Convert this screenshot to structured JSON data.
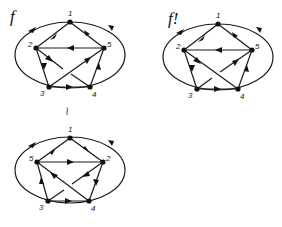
{
  "diagram": {
    "type": "directed-graph-comparison",
    "graphs": [
      {
        "id": "f",
        "label": "f",
        "nodes": [
          {
            "id": "1",
            "label": "1",
            "x": 70,
            "y": 22
          },
          {
            "id": "2",
            "label": "2",
            "x": 36,
            "y": 48
          },
          {
            "id": "5",
            "label": "5",
            "x": 104,
            "y": 48
          },
          {
            "id": "3",
            "label": "3",
            "x": 49,
            "y": 87
          },
          {
            "id": "4",
            "label": "4",
            "x": 90,
            "y": 87
          }
        ],
        "edges": [
          [
            "1",
            "2"
          ],
          [
            "5",
            "1"
          ],
          [
            "5",
            "2"
          ],
          [
            "2",
            "3"
          ],
          [
            "2",
            "4"
          ],
          [
            "3",
            "5"
          ],
          [
            "3",
            "4"
          ],
          [
            "4",
            "5"
          ]
        ],
        "outer_ellipse": {
          "cx": 70,
          "cy": 55,
          "rx": 55,
          "ry": 34,
          "arcs": [
            "1→3 (left)",
            "4→1 (right)"
          ]
        }
      },
      {
        "id": "f!",
        "label": "f!",
        "nodes": [
          {
            "id": "1",
            "label": "1",
            "x": 218,
            "y": 24
          },
          {
            "id": "2",
            "label": "2",
            "x": 184,
            "y": 50
          },
          {
            "id": "5",
            "label": "5",
            "x": 252,
            "y": 50
          },
          {
            "id": "3",
            "label": "3",
            "x": 197,
            "y": 89
          },
          {
            "id": "4",
            "label": "4",
            "x": 238,
            "y": 89
          }
        ],
        "edges": [
          [
            "1",
            "2"
          ],
          [
            "5",
            "1"
          ],
          [
            "5",
            "2"
          ],
          [
            "2",
            "3"
          ],
          [
            "2",
            "4"
          ],
          [
            "3",
            "5"
          ],
          [
            "3",
            "4"
          ],
          [
            "4",
            "5"
          ]
        ],
        "outer_ellipse": {
          "cx": 218,
          "cy": 57,
          "rx": 55,
          "ry": 34,
          "arcs": [
            "1→3 (left)",
            "4→1 (right)"
          ]
        }
      },
      {
        "id": "f-relabeled",
        "label": "",
        "nodes": [
          {
            "id": "1",
            "label": "1",
            "x": 70,
            "y": 138
          },
          {
            "id": "5",
            "label": "5",
            "x": 37,
            "y": 162
          },
          {
            "id": "2",
            "label": "2",
            "x": 103,
            "y": 162
          },
          {
            "id": "3",
            "label": "3",
            "x": 48,
            "y": 201
          },
          {
            "id": "4",
            "label": "4",
            "x": 89,
            "y": 201
          }
        ],
        "edges": [
          [
            "5",
            "1"
          ],
          [
            "1",
            "2"
          ],
          [
            "5",
            "2"
          ],
          [
            "2",
            "4"
          ],
          [
            "2",
            "3"
          ],
          [
            "4",
            "5"
          ],
          [
            "3",
            "5"
          ],
          [
            "3",
            "4"
          ]
        ],
        "outer_ellipse": {
          "cx": 70,
          "cy": 170,
          "rx": 55,
          "ry": 34,
          "arcs": [
            "1→3 (left)",
            "4→1 (right)"
          ]
        }
      }
    ],
    "isomorphism_symbol": "≀",
    "colors": {
      "stroke": "#1a1a1a",
      "node": "#111111",
      "label": "#222222"
    }
  }
}
